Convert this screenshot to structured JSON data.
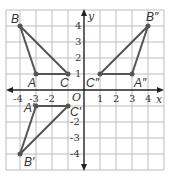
{
  "diagram": {
    "type": "coordinate-grid",
    "axes": {
      "x_label": "x",
      "y_label": "y",
      "origin_label": "O"
    },
    "x_ticks": [
      "-4",
      "-3",
      "-2",
      "1",
      "2",
      "3",
      "4"
    ],
    "y_ticks": [
      "4",
      "3",
      "2",
      "1",
      "-2",
      "-3",
      "-4"
    ],
    "triangles": [
      {
        "name": "ABC",
        "points": {
          "A": [
            -3,
            1
          ],
          "B": [
            -4,
            4
          ],
          "C": [
            -1,
            1
          ]
        }
      },
      {
        "name": "A'B'C'",
        "points": {
          "A'": [
            -3,
            -1
          ],
          "B'": [
            -4,
            -4
          ],
          "C'": [
            -1,
            -1
          ]
        }
      },
      {
        "name": "A''B''C''",
        "points": {
          "A''": [
            3,
            1
          ],
          "B''": [
            4,
            4
          ],
          "C''": [
            1,
            1
          ]
        }
      }
    ],
    "labels": {
      "A": "A",
      "B": "B",
      "C": "C",
      "A1": "A′",
      "B1": "B′",
      "C1": "C′",
      "A2": "A″",
      "B2": "B″",
      "C2": "C″"
    },
    "colors": {
      "triangle": "#555555",
      "grid": "#bbbbbb",
      "axis": "#222222"
    }
  }
}
